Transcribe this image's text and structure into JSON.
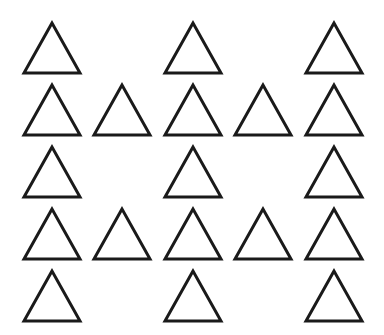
{
  "figure": {
    "stroke_color": "#1a1a1a",
    "fill_color": "#ffffff",
    "stroke_width": 3,
    "triangle_width": 56,
    "triangle_height": 50,
    "column_centers": [
      52,
      122,
      193,
      263,
      334
    ],
    "row_tops": [
      23,
      85,
      147,
      209,
      271
    ],
    "rows": [
      {
        "columns": [
          0,
          2,
          4
        ]
      },
      {
        "columns": [
          0,
          1,
          2,
          3,
          4
        ]
      },
      {
        "columns": [
          0,
          2,
          4
        ]
      },
      {
        "columns": [
          0,
          1,
          2,
          3,
          4
        ]
      },
      {
        "columns": [
          0,
          2,
          4
        ]
      }
    ],
    "triangle_count": 19
  }
}
